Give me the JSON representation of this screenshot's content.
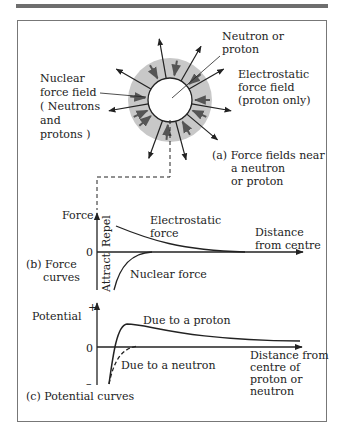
{
  "panel_a": {
    "label_neutron_proton": [
      "Neutron or",
      "proton"
    ],
    "label_nuclear": [
      "Nuclear",
      "force field",
      "( Neutrons",
      "and",
      "protons )"
    ],
    "label_electrostatic": [
      "Electrostatic",
      "force field",
      "(proton only)"
    ],
    "caption": [
      "(a)  Force fields near",
      "a neutron",
      "or proton"
    ]
  },
  "panel_b": {
    "y_axis_label": "Force",
    "zero_label": "0",
    "repel_label": "Repel",
    "attract_label": "Attract",
    "electrostatic_label": [
      "Electrostatic",
      "force"
    ],
    "nuclear_label": "Nuclear force",
    "x_axis_label": [
      "Distance",
      "from centre"
    ],
    "caption": [
      "(b)  Force",
      "curves"
    ]
  },
  "panel_c": {
    "y_axis_label": "Potential",
    "plus_label": "+",
    "minus_label": "–",
    "zero_label": "0",
    "proton_label": "Due to a proton",
    "neutron_label": "Due to a neutron",
    "x_axis_label": [
      "Distance from",
      "centre of",
      "proton or",
      "neutron"
    ],
    "caption": "(c) Potential curves"
  },
  "colors": {
    "line": "#222222",
    "halo": "#c8c8c8",
    "frame": "#777777",
    "topbar": "#6e6e6e"
  }
}
